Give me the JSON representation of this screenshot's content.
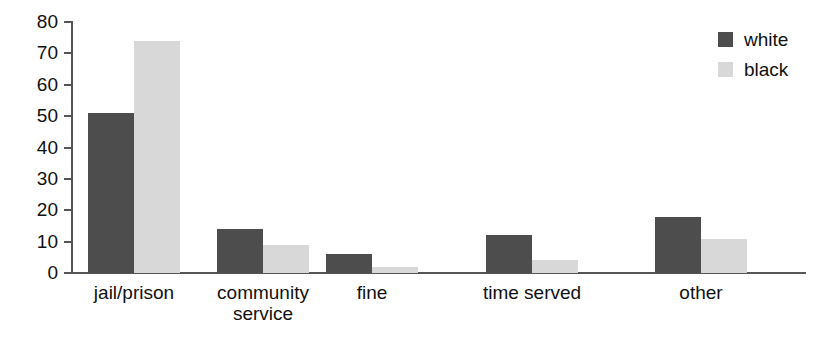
{
  "chart_data": {
    "type": "bar",
    "title": "",
    "xlabel": "",
    "ylabel": "",
    "categories": [
      "jail/prison",
      "community\nservice",
      "fine",
      "time served",
      "other"
    ],
    "series": [
      {
        "name": "white",
        "color": "#4d4d4d",
        "values": [
          51,
          14,
          6,
          12,
          18
        ]
      },
      {
        "name": "black",
        "color": "#d8d8d8",
        "values": [
          74,
          9,
          2,
          4,
          11
        ]
      }
    ],
    "ylim": [
      0,
      80
    ],
    "yticks": [
      0,
      10,
      20,
      30,
      40,
      50,
      60,
      70,
      80
    ],
    "ytick_labels": [
      "0",
      "10",
      "20",
      "30",
      "40",
      "50",
      "60",
      "70",
      "80"
    ],
    "grid": false,
    "legend": {
      "position": "top-right",
      "entries": [
        {
          "label": "white",
          "color": "#4d4d4d"
        },
        {
          "label": "black",
          "color": "#d8d8d8"
        }
      ]
    }
  }
}
